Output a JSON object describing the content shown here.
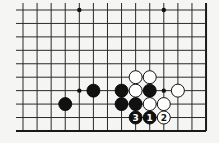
{
  "diagram": {
    "type": "go-board-fragment",
    "columns": 14,
    "rows": 10,
    "open_sides": [
      "top",
      "left"
    ],
    "closed_sides": [
      "right",
      "bottom"
    ],
    "hoshi": [
      {
        "col": 4,
        "row": 0
      },
      {
        "col": 10,
        "row": 0
      },
      {
        "col": 4,
        "row": 6
      },
      {
        "col": 10,
        "row": 6
      }
    ],
    "stones": [
      {
        "col": 8,
        "row": 5,
        "color": "white"
      },
      {
        "col": 9,
        "row": 5,
        "color": "white"
      },
      {
        "col": 7,
        "row": 6,
        "color": "black"
      },
      {
        "col": 8,
        "row": 6,
        "color": "white"
      },
      {
        "col": 9,
        "row": 6,
        "color": "black"
      },
      {
        "col": 11,
        "row": 6,
        "color": "white"
      },
      {
        "col": 5,
        "row": 6,
        "color": "black"
      },
      {
        "col": 3,
        "row": 7,
        "color": "black"
      },
      {
        "col": 7,
        "row": 7,
        "color": "black"
      },
      {
        "col": 8,
        "row": 7,
        "color": "black"
      },
      {
        "col": 9,
        "row": 7,
        "color": "white"
      },
      {
        "col": 10,
        "row": 7,
        "color": "white"
      },
      {
        "col": 8,
        "row": 8,
        "color": "black",
        "label": "3"
      },
      {
        "col": 9,
        "row": 8,
        "color": "black",
        "label": "1"
      },
      {
        "col": 10,
        "row": 8,
        "color": "white",
        "label": "2"
      }
    ],
    "colors": {
      "background": "#f5f5f3",
      "line": "#2a2a2a",
      "black_stone": "#111111",
      "white_stone": "#ffffff"
    }
  }
}
